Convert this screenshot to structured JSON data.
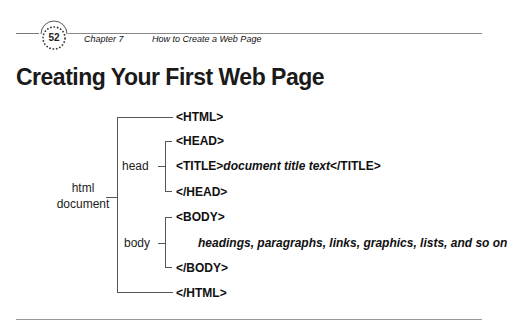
{
  "header": {
    "page_number": "52",
    "chapter": "Chapter 7",
    "chapter_title": "How to Create a Web Page"
  },
  "title": "Creating Your First Web Page",
  "diagram": {
    "root_label_line1": "html",
    "root_label_line2": "document",
    "head_label": "head",
    "body_label": "body",
    "html_open": "<HTML>",
    "head_open": "<HEAD>",
    "title_open": "<TITLE>",
    "title_text": "document title text",
    "title_close": "</TITLE>",
    "head_close": "</HEAD>",
    "body_open": "<BODY>",
    "body_content": "headings, paragraphs, links, graphics, lists, and so on",
    "body_close": "</BODY>",
    "html_close": "</HTML>"
  }
}
